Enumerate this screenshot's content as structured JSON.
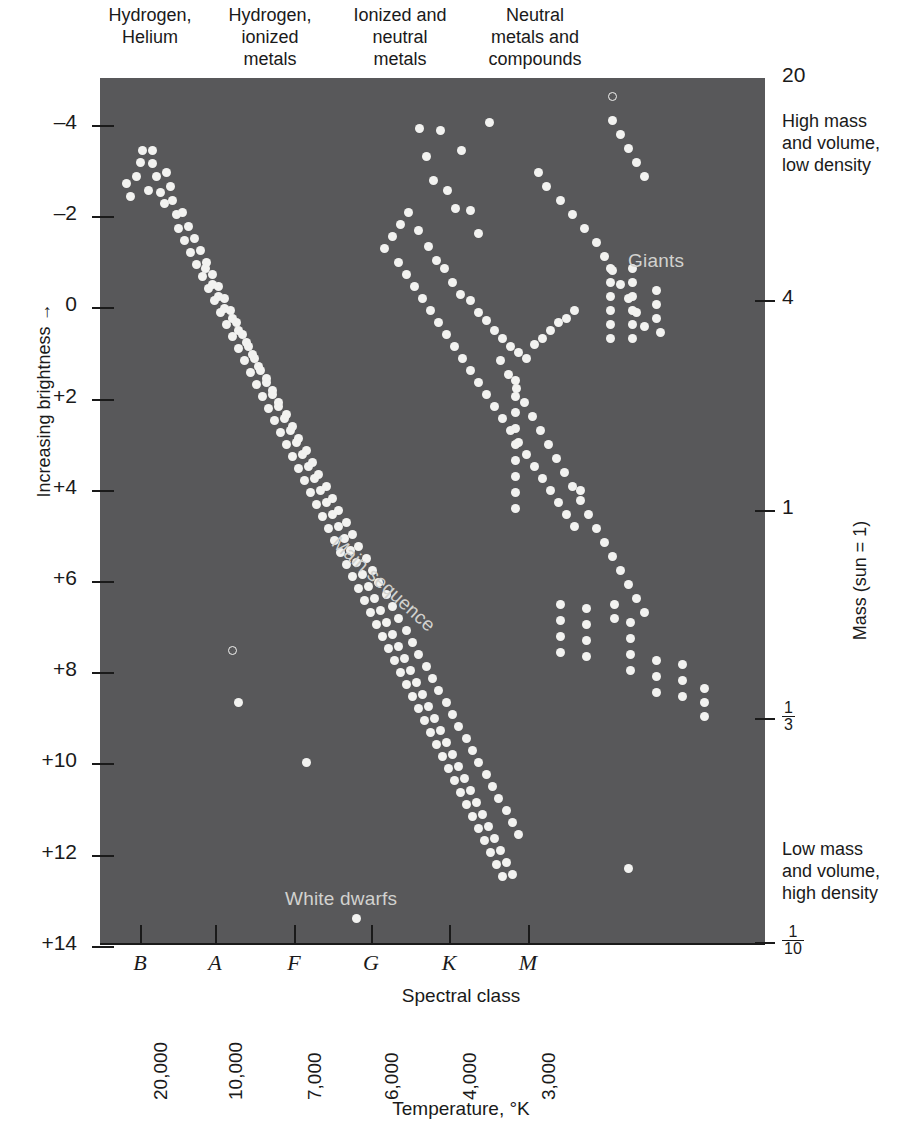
{
  "figure": {
    "kind": "hertzsprung-russell-diagram",
    "plot_background_color": "#58585a",
    "star_color": "#f2f2f0",
    "annotation_color": "#d2d2cf"
  },
  "top_captions": [
    "Hydrogen,\nHelium",
    "Hydrogen,\nionized\nmetals",
    "Ionized and\nneutral\nmetals",
    "Neutral\nmetals and\ncompounds"
  ],
  "left_axis": {
    "title": "Increasing brightness →",
    "ticks": [
      "–4",
      "–2",
      "0",
      "+2",
      "+4",
      "+6",
      "+8",
      "+10",
      "+12",
      "+14"
    ],
    "tick_values": [
      -4,
      -2,
      0,
      2,
      4,
      6,
      8,
      10,
      12,
      14
    ]
  },
  "right_axis": {
    "title": "Mass (sun = 1)",
    "ticks": [
      {
        "label": "20",
        "kind": "plain",
        "num": "",
        "den": ""
      },
      {
        "label": "4",
        "kind": "plain",
        "num": "",
        "den": ""
      },
      {
        "label": "1",
        "kind": "plain",
        "num": "",
        "den": ""
      },
      {
        "label": "",
        "kind": "fraction",
        "num": "1",
        "den": "3"
      },
      {
        "label": "",
        "kind": "fraction",
        "num": "1",
        "den": "10"
      }
    ],
    "note_high": "High mass\nand volume,\nlow density",
    "note_low": "Low mass\nand volume,\nhigh density"
  },
  "bottom_axis": {
    "title": "Spectral class",
    "classes": [
      "B",
      "A",
      "F",
      "G",
      "K",
      "M"
    ],
    "temperature_title": "Temperature, °K",
    "temperatures": [
      "20,000",
      "10,000",
      "7,000",
      "6,000",
      "4,000",
      "3,000"
    ]
  },
  "plot_annotations": {
    "giants": "Giants",
    "white_dwarfs": "White dwarfs",
    "main_sequence": "Main sequence"
  },
  "chart_data": {
    "type": "scatter",
    "xlabel": "Spectral class",
    "ylabel": "Increasing brightness",
    "grid": false,
    "legend": false,
    "x_axis": {
      "kind": "categorical-positional",
      "categories": [
        "B",
        "A",
        "F",
        "G",
        "K",
        "M"
      ],
      "category_positions_px": [
        140,
        215,
        294,
        371,
        449,
        528
      ],
      "secondary_ticks": [
        "20,000",
        "10,000",
        "7,000",
        "6,000",
        "4,000",
        "3,000"
      ],
      "secondary_label": "Temperature, °K"
    },
    "y_axis": {
      "kind": "absolute-magnitude",
      "ticks": [
        -4,
        -2,
        0,
        2,
        4,
        6,
        8,
        10,
        12,
        14
      ],
      "inverted": true,
      "ylim": [
        -5,
        15
      ]
    },
    "y_axis_right": {
      "kind": "mass-sun-units",
      "ticks": [
        "20",
        "4",
        "1",
        "1/3",
        "1/10"
      ],
      "label": "Mass (sun = 1)"
    },
    "populations": [
      {
        "name": "Main sequence",
        "description": "dense diagonal band from upper-left hot bright stars to lower-right cool faint stars"
      },
      {
        "name": "Giants",
        "description": "loose cluster of bright stars in the G-K-M region above the main sequence"
      },
      {
        "name": "White dwarfs",
        "description": "few faint stars at magnitudes +10 to +14 in the A-F region"
      }
    ],
    "points": [
      [
        126,
        183
      ],
      [
        136,
        176
      ],
      [
        130,
        196
      ],
      [
        142,
        150
      ],
      [
        152,
        150
      ],
      [
        140,
        162
      ],
      [
        152,
        163
      ],
      [
        156,
        176
      ],
      [
        148,
        190
      ],
      [
        160,
        192
      ],
      [
        166,
        172
      ],
      [
        170,
        186
      ],
      [
        164,
        203
      ],
      [
        172,
        200
      ],
      [
        176,
        214
      ],
      [
        182,
        212
      ],
      [
        178,
        228
      ],
      [
        188,
        226
      ],
      [
        184,
        240
      ],
      [
        194,
        238
      ],
      [
        190,
        252
      ],
      [
        200,
        250
      ],
      [
        196,
        264
      ],
      [
        206,
        262
      ],
      [
        202,
        276
      ],
      [
        212,
        274
      ],
      [
        208,
        288
      ],
      [
        218,
        286
      ],
      [
        214,
        300
      ],
      [
        224,
        298
      ],
      [
        220,
        312
      ],
      [
        230,
        310
      ],
      [
        226,
        324
      ],
      [
        236,
        322
      ],
      [
        232,
        336
      ],
      [
        242,
        334
      ],
      [
        238,
        348
      ],
      [
        248,
        346
      ],
      [
        244,
        360
      ],
      [
        254,
        358
      ],
      [
        250,
        372
      ],
      [
        260,
        370
      ],
      [
        256,
        384
      ],
      [
        266,
        382
      ],
      [
        262,
        396
      ],
      [
        272,
        394
      ],
      [
        268,
        408
      ],
      [
        278,
        406
      ],
      [
        274,
        420
      ],
      [
        284,
        418
      ],
      [
        280,
        432
      ],
      [
        290,
        430
      ],
      [
        286,
        444
      ],
      [
        296,
        442
      ],
      [
        292,
        456
      ],
      [
        302,
        454
      ],
      [
        298,
        468
      ],
      [
        308,
        466
      ],
      [
        304,
        480
      ],
      [
        314,
        478
      ],
      [
        310,
        492
      ],
      [
        320,
        490
      ],
      [
        316,
        504
      ],
      [
        326,
        502
      ],
      [
        322,
        516
      ],
      [
        332,
        514
      ],
      [
        328,
        528
      ],
      [
        338,
        526
      ],
      [
        334,
        540
      ],
      [
        344,
        538
      ],
      [
        340,
        552
      ],
      [
        350,
        550
      ],
      [
        346,
        564
      ],
      [
        356,
        562
      ],
      [
        352,
        576
      ],
      [
        362,
        574
      ],
      [
        358,
        588
      ],
      [
        368,
        586
      ],
      [
        364,
        600
      ],
      [
        374,
        598
      ],
      [
        370,
        612
      ],
      [
        380,
        610
      ],
      [
        376,
        624
      ],
      [
        386,
        622
      ],
      [
        382,
        636
      ],
      [
        392,
        634
      ],
      [
        388,
        648
      ],
      [
        398,
        646
      ],
      [
        394,
        660
      ],
      [
        404,
        658
      ],
      [
        400,
        672
      ],
      [
        410,
        670
      ],
      [
        406,
        684
      ],
      [
        416,
        682
      ],
      [
        412,
        696
      ],
      [
        422,
        694
      ],
      [
        418,
        708
      ],
      [
        428,
        706
      ],
      [
        424,
        720
      ],
      [
        434,
        718
      ],
      [
        430,
        732
      ],
      [
        440,
        730
      ],
      [
        436,
        744
      ],
      [
        446,
        742
      ],
      [
        442,
        756
      ],
      [
        452,
        754
      ],
      [
        448,
        768
      ],
      [
        458,
        766
      ],
      [
        454,
        780
      ],
      [
        464,
        778
      ],
      [
        460,
        792
      ],
      [
        470,
        790
      ],
      [
        466,
        804
      ],
      [
        476,
        802
      ],
      [
        472,
        816
      ],
      [
        482,
        814
      ],
      [
        478,
        828
      ],
      [
        488,
        826
      ],
      [
        484,
        840
      ],
      [
        494,
        838
      ],
      [
        490,
        852
      ],
      [
        500,
        850
      ],
      [
        496,
        864
      ],
      [
        506,
        862
      ],
      [
        502,
        876
      ],
      [
        512,
        874
      ],
      [
        205,
        268
      ],
      [
        212,
        284
      ],
      [
        218,
        296
      ],
      [
        224,
        308
      ],
      [
        232,
        318
      ],
      [
        238,
        330
      ],
      [
        246,
        342
      ],
      [
        252,
        354
      ],
      [
        258,
        366
      ],
      [
        266,
        378
      ],
      [
        272,
        390
      ],
      [
        278,
        402
      ],
      [
        286,
        414
      ],
      [
        292,
        426
      ],
      [
        298,
        438
      ],
      [
        306,
        450
      ],
      [
        312,
        462
      ],
      [
        318,
        474
      ],
      [
        326,
        486
      ],
      [
        332,
        498
      ],
      [
        338,
        510
      ],
      [
        346,
        522
      ],
      [
        352,
        534
      ],
      [
        358,
        546
      ],
      [
        366,
        558
      ],
      [
        372,
        570
      ],
      [
        378,
        582
      ],
      [
        386,
        594
      ],
      [
        392,
        606
      ],
      [
        398,
        618
      ],
      [
        406,
        630
      ],
      [
        412,
        642
      ],
      [
        418,
        654
      ],
      [
        426,
        666
      ],
      [
        432,
        678
      ],
      [
        438,
        690
      ],
      [
        446,
        702
      ],
      [
        452,
        714
      ],
      [
        458,
        726
      ],
      [
        466,
        738
      ],
      [
        472,
        750
      ],
      [
        478,
        762
      ],
      [
        486,
        774
      ],
      [
        492,
        786
      ],
      [
        498,
        798
      ],
      [
        506,
        810
      ],
      [
        512,
        822
      ],
      [
        518,
        834
      ],
      [
        419,
        128
      ],
      [
        426,
        156
      ],
      [
        433,
        180
      ],
      [
        447,
        190
      ],
      [
        455,
        208
      ],
      [
        461,
        150
      ],
      [
        440,
        130
      ],
      [
        470,
        210
      ],
      [
        478,
        233
      ],
      [
        489,
        122
      ],
      [
        418,
        230
      ],
      [
        428,
        246
      ],
      [
        436,
        260
      ],
      [
        444,
        268
      ],
      [
        452,
        282
      ],
      [
        460,
        294
      ],
      [
        470,
        300
      ],
      [
        478,
        312
      ],
      [
        486,
        320
      ],
      [
        494,
        330
      ],
      [
        502,
        338
      ],
      [
        510,
        346
      ],
      [
        518,
        352
      ],
      [
        526,
        358
      ],
      [
        534,
        344
      ],
      [
        542,
        338
      ],
      [
        550,
        330
      ],
      [
        558,
        322
      ],
      [
        566,
        318
      ],
      [
        574,
        310
      ],
      [
        408,
        212
      ],
      [
        400,
        224
      ],
      [
        392,
        236
      ],
      [
        384,
        248
      ],
      [
        398,
        262
      ],
      [
        406,
        274
      ],
      [
        414,
        286
      ],
      [
        422,
        298
      ],
      [
        430,
        310
      ],
      [
        438,
        322
      ],
      [
        446,
        334
      ],
      [
        454,
        346
      ],
      [
        462,
        358
      ],
      [
        470,
        370
      ],
      [
        478,
        382
      ],
      [
        486,
        394
      ],
      [
        494,
        406
      ],
      [
        502,
        418
      ],
      [
        510,
        430
      ],
      [
        518,
        442
      ],
      [
        526,
        454
      ],
      [
        534,
        466
      ],
      [
        542,
        478
      ],
      [
        550,
        490
      ],
      [
        558,
        502
      ],
      [
        566,
        514
      ],
      [
        574,
        526
      ],
      [
        538,
        172
      ],
      [
        546,
        186
      ],
      [
        560,
        200
      ],
      [
        572,
        214
      ],
      [
        584,
        228
      ],
      [
        596,
        242
      ],
      [
        604,
        256
      ],
      [
        612,
        270
      ],
      [
        620,
        284
      ],
      [
        628,
        298
      ],
      [
        636,
        312
      ],
      [
        644,
        326
      ],
      [
        612,
        120
      ],
      [
        620,
        134
      ],
      [
        628,
        148
      ],
      [
        636,
        162
      ],
      [
        644,
        176
      ],
      [
        610,
        268
      ],
      [
        610,
        282
      ],
      [
        610,
        296
      ],
      [
        610,
        310
      ],
      [
        610,
        324
      ],
      [
        610,
        338
      ],
      [
        632,
        268
      ],
      [
        632,
        282
      ],
      [
        632,
        296
      ],
      [
        632,
        310
      ],
      [
        632,
        324
      ],
      [
        632,
        338
      ],
      [
        656,
        290
      ],
      [
        656,
        304
      ],
      [
        656,
        318
      ],
      [
        660,
        332
      ],
      [
        500,
        360
      ],
      [
        508,
        374
      ],
      [
        516,
        388
      ],
      [
        524,
        402
      ],
      [
        532,
        416
      ],
      [
        540,
        430
      ],
      [
        548,
        444
      ],
      [
        556,
        458
      ],
      [
        564,
        472
      ],
      [
        572,
        486
      ],
      [
        580,
        500
      ],
      [
        588,
        514
      ],
      [
        596,
        528
      ],
      [
        604,
        542
      ],
      [
        612,
        556
      ],
      [
        620,
        570
      ],
      [
        628,
        584
      ],
      [
        636,
        598
      ],
      [
        644,
        612
      ],
      [
        515,
        380
      ],
      [
        515,
        396
      ],
      [
        515,
        412
      ],
      [
        515,
        428
      ],
      [
        515,
        444
      ],
      [
        515,
        460
      ],
      [
        515,
        476
      ],
      [
        515,
        492
      ],
      [
        515,
        508
      ],
      [
        560,
        604
      ],
      [
        560,
        620
      ],
      [
        560,
        636
      ],
      [
        560,
        652
      ],
      [
        586,
        608
      ],
      [
        586,
        624
      ],
      [
        586,
        640
      ],
      [
        586,
        656
      ],
      [
        614,
        604
      ],
      [
        614,
        618
      ],
      [
        630,
        622
      ],
      [
        630,
        638
      ],
      [
        630,
        654
      ],
      [
        630,
        670
      ],
      [
        656,
        660
      ],
      [
        656,
        676
      ],
      [
        656,
        692
      ],
      [
        682,
        664
      ],
      [
        682,
        680
      ],
      [
        682,
        696
      ],
      [
        238,
        702
      ],
      [
        306,
        762
      ],
      [
        356,
        918
      ],
      [
        628,
        868
      ],
      [
        580,
        490
      ],
      [
        704,
        688
      ],
      [
        704,
        702
      ],
      [
        704,
        716
      ]
    ],
    "open_points": [
      [
        612,
        96
      ],
      [
        232,
        650
      ]
    ],
    "point_count_approx": 430
  }
}
